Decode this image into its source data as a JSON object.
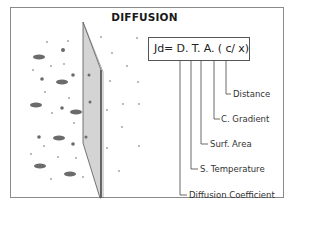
{
  "title": "DIFFUSION",
  "equation": "Jd= D. T. A. ( c/ x)",
  "labels": {
    "distance": "Distance",
    "c_gradient": "C. Gradient",
    "surf_area": "Surf. Area",
    "s_temperature": "S. Temperature",
    "diffusion_coefficient": "Diffusion Coefficient"
  },
  "colors": {
    "frame": "#8a8a8a",
    "membrane_fill": "#d4d4d4",
    "membrane_stroke": "#555555",
    "particle": "#6b6b6b",
    "small_particle": "#9a9a9a"
  }
}
